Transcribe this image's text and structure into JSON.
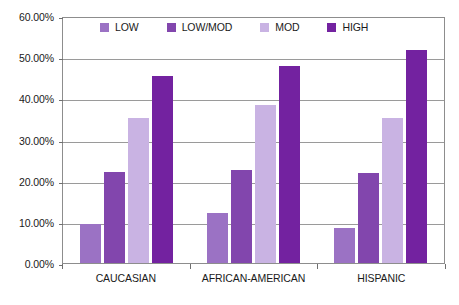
{
  "chart_data": {
    "type": "bar",
    "title": "",
    "subtitle": "",
    "xlabel": "",
    "ylabel": "",
    "ylim": [
      0,
      60
    ],
    "ytick_labels": [
      "60.00%",
      "50.00%",
      "40.00%",
      "30.00%",
      "20.00%",
      "10.00%",
      "0.00%"
    ],
    "ytick_values": [
      60,
      50,
      40,
      30,
      20,
      10,
      0
    ],
    "grid": true,
    "legend_position": "top-inside",
    "value_suffix": "%",
    "categories": [
      "CAUCASIAN",
      "AFRICAN-AMERICAN",
      "HISPANIC"
    ],
    "series": [
      {
        "name": "LOW",
        "color": "#9b72c4",
        "values": [
          9.5,
          12.1,
          8.4
        ]
      },
      {
        "name": "LOW/MOD",
        "color": "#8246ad",
        "values": [
          22.2,
          22.5,
          21.9
        ]
      },
      {
        "name": "MOD",
        "color": "#c9b3e3",
        "values": [
          35.2,
          38.5,
          35.2
        ]
      },
      {
        "name": "HIGH",
        "color": "#7322a0",
        "values": [
          45.4,
          47.8,
          51.8
        ]
      }
    ]
  },
  "axis_colors": {
    "gridline": "#9a9a9a",
    "frame": "#8d8d8d",
    "text": "#1a1a1a",
    "background": "#ffffff"
  }
}
